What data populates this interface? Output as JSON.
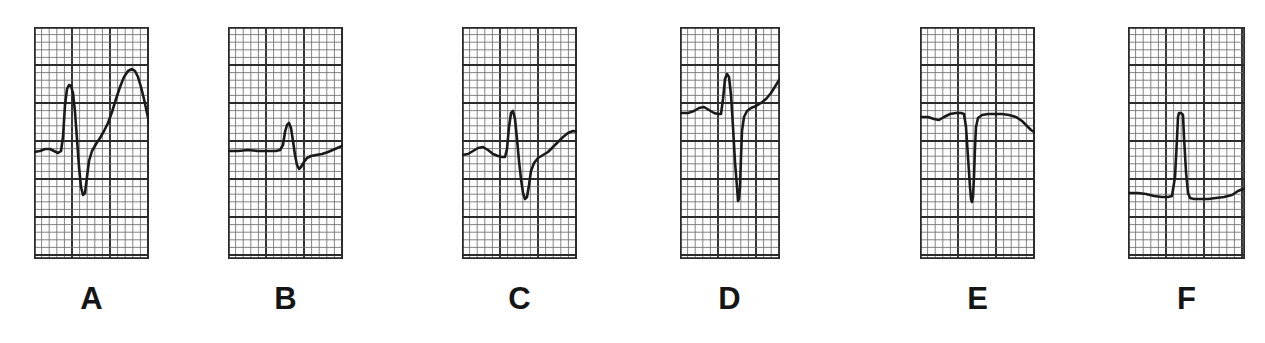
{
  "figure": {
    "kind": "ecg-strip-montage",
    "background_color": "#ffffff",
    "trace_color": "#1a1a1a",
    "grid_minor_color": "#6e6e6e",
    "grid_major_color": "#2b2b2b",
    "width": 1265,
    "height": 343,
    "panel_count": 6
  },
  "panels": [
    {
      "label": "A",
      "x": 34,
      "y": 27,
      "w": 115,
      "h": 232,
      "label_x": 34,
      "label_y": 283,
      "label_w": 115,
      "grid": {
        "minor_step": 7.6,
        "major_every": 5,
        "minor_lw": 0.85,
        "major_lw": 1.9
      },
      "baseline_y": 152,
      "description": "Slow upstroke R with deep narrow S and very tall broad T wave",
      "trace": "M 0,125 L 6,124 L 11,122 L 16,122 L 20,124 L 24,126 L 27,124 L 29,110 L 31,78 L 33,62 L 35,58 L 37,59 L 39,66 L 41,85 L 43,112 L 45,140 L 47,160 L 49,168 L 51,166 L 53,150 L 55,134 L 58,124 L 62,117 L 66,111 L 70,104 L 74,96 L 78,85 L 82,72 L 86,60 L 90,50 L 94,44 L 98,42 L 101,44 L 104,50 L 107,60 L 110,72 L 113,86 L 116,100 L 119,112 L 122,120 L 125,125 L 129,128 L 133,128 L 137,126 L 141,122 L 145,119 L 149,118 L 154,119 L 159,121 L 164,124 L 170,126 L 176,127 L 182,127"
    },
    {
      "label": "B",
      "x": 228,
      "y": 27,
      "w": 115,
      "h": 232,
      "label_x": 228,
      "label_y": 283,
      "label_w": 115,
      "grid": {
        "minor_step": 7.6,
        "major_every": 5,
        "minor_lw": 0.85,
        "major_lw": 1.9
      },
      "baseline_y": 150,
      "description": "Flat baseline, small sharp R, small S, low rounded T",
      "trace": "M 0,124 L 10,124 L 20,123 L 30,124 L 40,124 L 48,124 L 52,123 L 55,118 L 57,105 L 59,98 L 61,96 L 63,101 L 65,114 L 67,128 L 69,138 L 71,142 L 73,140 L 76,135 L 79,131 L 83,129 L 88,128 L 94,127 L 100,125 L 107,122 L 114,119 L 121,117 L 128,116 L 134,116 L 140,117 L 146,120 L 152,123 L 158,125 L 165,126 L 172,126 L 180,126"
    },
    {
      "label": "C",
      "x": 462,
      "y": 27,
      "w": 115,
      "h": 232,
      "label_x": 462,
      "label_y": 283,
      "label_w": 115,
      "grid": {
        "minor_step": 7.6,
        "major_every": 5,
        "minor_lw": 0.85,
        "major_lw": 1.9
      },
      "baseline_y": 155,
      "description": "Small P hump, tall narrow R, deep S, broad symmetric T wave",
      "trace": "M 0,128 L 6,127 L 11,124 L 16,121 L 21,120 L 26,123 L 31,127 L 36,129 L 40,130 L 43,130 L 45,122 L 47,100 L 49,86 L 51,84 L 53,92 L 55,112 L 57,134 L 59,152 L 61,166 L 63,172 L 65,170 L 67,158 L 69,144 L 72,136 L 76,131 L 81,128 L 86,125 L 91,120 L 96,115 L 101,110 L 106,106 L 111,104 L 116,105 L 120,109 L 124,116 L 128,123 L 131,127 L 135,129 L 140,130 L 146,130 L 152,129 L 158,129 L 166,129 L 174,129 L 182,129"
    },
    {
      "label": "D",
      "x": 680,
      "y": 27,
      "w": 100,
      "h": 232,
      "label_x": 672,
      "label_y": 283,
      "label_w": 115,
      "grid": {
        "minor_step": 7.6,
        "major_every": 5,
        "minor_lw": 0.85,
        "major_lw": 1.9
      },
      "baseline_y": 113,
      "description": "Small P, narrow tall R, very deep S extending far below, elevated ST rising to tall asymmetric T",
      "trace": "M 0,86 L 8,86 L 14,84 L 19,81 L 24,80 L 29,83 L 34,86 L 38,87 L 41,87 L 43,72 L 45,52 L 47,47 L 49,50 L 51,68 L 53,100 L 55,135 L 57,160 L 58,174 L 59,172 L 60,160 L 61,130 L 62,104 L 64,90 L 67,84 L 71,81 L 76,79 L 81,76 L 86,72 L 91,66 L 96,58 L 101,50 L 106,45 L 110,44 L 113,47 L 116,55 L 119,67 L 122,78 L 125,85 L 128,88 L 132,89 L 137,89 L 143,89 L 150,89"
    },
    {
      "label": "E",
      "x": 920,
      "y": 27,
      "w": 115,
      "h": 232,
      "label_x": 920,
      "label_y": 283,
      "label_w": 115,
      "grid": {
        "minor_step": 7.6,
        "major_every": 5,
        "minor_lw": 0.85,
        "major_lw": 1.9
      },
      "baseline_y": 115,
      "description": "Nearly flat baseline with narrow deep QS spike and gentle terminal T dip",
      "trace": "M 0,90 L 8,90 L 14,92 L 19,93 L 24,90 L 30,87 L 36,86 L 41,86 L 44,87 L 46,100 L 48,130 L 50,160 L 51,172 L 52,175 L 53,170 L 54,150 L 55,120 L 56,100 L 58,91 L 62,88 L 68,87 L 75,87 L 82,87 L 89,88 L 96,90 L 102,94 L 107,99 L 111,103 L 114,105 L 117,102 L 120,96 L 124,91 L 129,88 L 135,87 L 142,87 L 150,87"
    },
    {
      "label": "F",
      "x": 1128,
      "y": 27,
      "w": 117,
      "h": 232,
      "label_x": 1128,
      "label_y": 283,
      "label_w": 117,
      "grid": {
        "minor_step": 7.6,
        "major_every": 5,
        "minor_lw": 0.85,
        "major_lw": 1.9
      },
      "baseline_y": 193,
      "description": "Heavy flat baseline with a tall narrow R spike, small dip after, then flat",
      "trace": "M 0,166 L 10,166 L 18,167 L 26,169 L 34,170 L 40,170 L 44,169 L 47,150 L 49,112 L 50,90 L 51,86 L 53,86 L 55,88 L 56,110 L 58,145 L 60,166 L 62,171 L 66,172 L 72,172 L 80,172 L 88,171 L 96,170 L 104,168 L 110,164 L 115,162 L 121,162 L 128,163 L 136,164 L 145,165 L 155,165"
    }
  ]
}
